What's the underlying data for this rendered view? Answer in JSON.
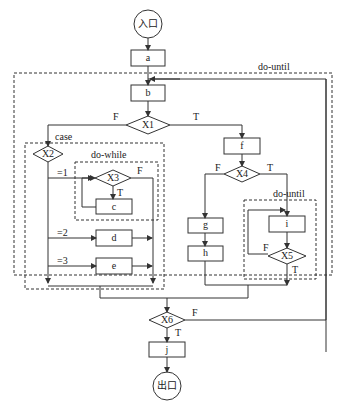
{
  "diagram": {
    "type": "flowchart",
    "line_color": "#333333",
    "dashed_color": "#444444",
    "background": "#ffffff"
  },
  "nodes": {
    "entry": {
      "label": "入口",
      "shape": "circle"
    },
    "a": {
      "label": "a",
      "shape": "rect"
    },
    "b": {
      "label": "b",
      "shape": "rect"
    },
    "x1": {
      "label": "X1",
      "shape": "diamond"
    },
    "x2": {
      "label": "X2",
      "shape": "diamond"
    },
    "x3": {
      "label": "X3",
      "shape": "diamond"
    },
    "c": {
      "label": "c",
      "shape": "rect"
    },
    "d": {
      "label": "d",
      "shape": "rect"
    },
    "e": {
      "label": "e",
      "shape": "rect"
    },
    "f": {
      "label": "f",
      "shape": "rect"
    },
    "x4": {
      "label": "X4",
      "shape": "diamond"
    },
    "g": {
      "label": "g",
      "shape": "rect"
    },
    "h": {
      "label": "h",
      "shape": "rect"
    },
    "i": {
      "label": "i",
      "shape": "rect"
    },
    "x5": {
      "label": "X5",
      "shape": "diamond"
    },
    "x6": {
      "label": "X6",
      "shape": "diamond"
    },
    "j": {
      "label": "j",
      "shape": "rect"
    },
    "exit": {
      "label": "出口",
      "shape": "circle"
    }
  },
  "regions": {
    "outer_loop": {
      "label": "do-until"
    },
    "case_block": {
      "label": "case"
    },
    "while_loop": {
      "label": "do-while"
    },
    "inner_until": {
      "label": "do-until"
    }
  },
  "edge_labels": {
    "x1_false": "F",
    "x1_true": "T",
    "x2_case1": "=1",
    "x2_case2": "=2",
    "x2_case3": "=3",
    "x3_true": "T",
    "x3_false": "F",
    "x4_false": "F",
    "x4_true": "T",
    "x5_false": "F",
    "x5_true": "T",
    "x6_false": "F",
    "x6_true": "T"
  }
}
